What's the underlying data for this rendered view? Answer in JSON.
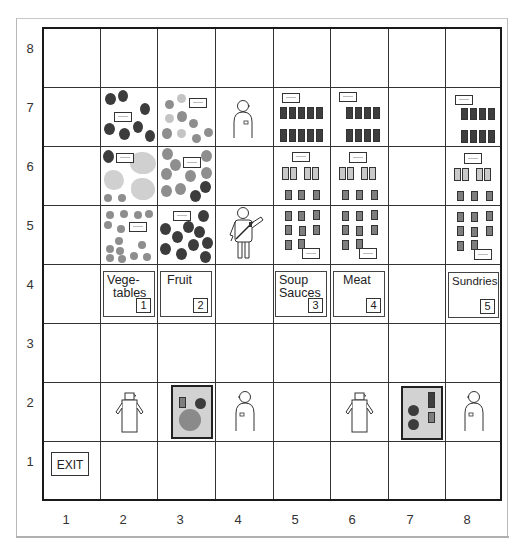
{
  "diagram": {
    "type": "store floor plan grid",
    "rows": [
      "8",
      "7",
      "6",
      "5",
      "4",
      "3",
      "2",
      "1"
    ],
    "columns": [
      "1",
      "2",
      "3",
      "4",
      "5",
      "6",
      "7",
      "8"
    ],
    "departments": [
      {
        "name": "Vege-",
        "name2": "tables",
        "number": "1",
        "col": 2,
        "row": 4
      },
      {
        "name": "Fruit",
        "name2": "",
        "number": "2",
        "col": 3,
        "row": 4
      },
      {
        "name": "Soup",
        "name2": "Sauces",
        "number": "3",
        "col": 5,
        "row": 4
      },
      {
        "name": "Meat",
        "name2": "",
        "number": "4",
        "col": 6,
        "row": 4
      },
      {
        "name": "Sundries",
        "name2": "",
        "number": "5",
        "col": 8,
        "row": 4
      }
    ],
    "exit_label": "EXIT",
    "figures": [
      {
        "kind": "clerk",
        "col": 4,
        "row": 7
      },
      {
        "kind": "shopper-pointing",
        "col": 4,
        "row": 5
      },
      {
        "kind": "shopper-back",
        "col": 2,
        "row": 2
      },
      {
        "kind": "cart-produce",
        "col": 3,
        "row": 2
      },
      {
        "kind": "clerk",
        "col": 4,
        "row": 2
      },
      {
        "kind": "shopper-back",
        "col": 6,
        "row": 2
      },
      {
        "kind": "cart-mixed",
        "col": 7,
        "row": 2
      },
      {
        "kind": "clerk",
        "col": 8,
        "row": 2
      }
    ],
    "colors": {
      "dark": "#3c3c3c",
      "mid": "#8e8e8e",
      "light": "#c9c9c9",
      "cart_bg": "#d2d2d2"
    }
  }
}
